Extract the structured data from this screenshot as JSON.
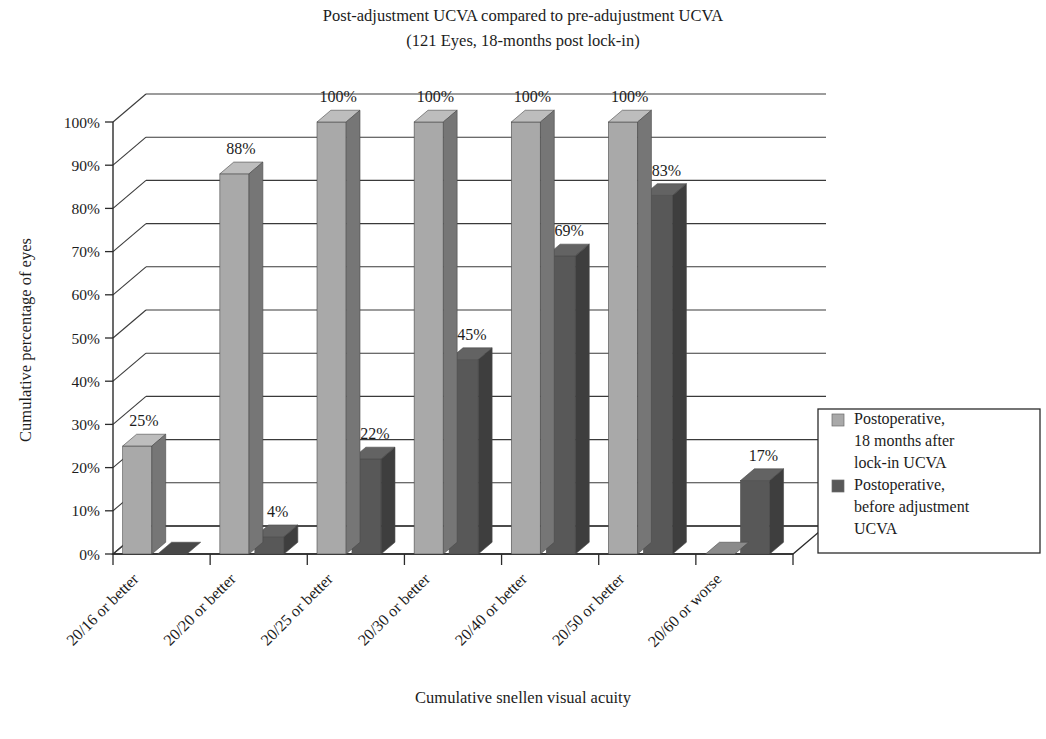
{
  "chart_data": {
    "type": "bar",
    "title": "Post-adjustment UCVA compared to pre-adujustment UCVA",
    "subtitle": "(121 Eyes, 18-months post lock-in)",
    "xlabel": "Cumulative snellen visual acuity",
    "ylabel": "Cumulative percentage of eyes",
    "ylim": [
      0,
      100
    ],
    "grid": true,
    "legend_position": "right",
    "three_d": true,
    "categories": [
      "20/16 or better",
      "20/20 or better",
      "20/25 or better",
      "20/30 or better",
      "20/40 or better",
      "20/50 or better",
      "20/60 or worse"
    ],
    "series": [
      {
        "name": "Postoperative, 18 months after lock-in UCVA",
        "color": "#a9a9a9",
        "values": [
          25,
          88,
          100,
          100,
          100,
          100,
          0
        ],
        "labels": [
          "25%",
          "88%",
          "100%",
          "100%",
          "100%",
          "100%",
          ""
        ]
      },
      {
        "name": "Postoperative, before adjustment UCVA",
        "color": "#585858",
        "values": [
          0,
          4,
          22,
          45,
          69,
          83,
          17
        ],
        "labels": [
          "",
          "4%",
          "22%",
          "45%",
          "69%",
          "83%",
          "17%"
        ]
      }
    ],
    "yticks": [
      "0%",
      "10%",
      "20%",
      "30%",
      "40%",
      "50%",
      "60%",
      "70%",
      "80%",
      "90%",
      "100%"
    ],
    "ytick_values": [
      0,
      10,
      20,
      30,
      40,
      50,
      60,
      70,
      80,
      90,
      100
    ]
  },
  "legend": {
    "entries": [
      {
        "swatch_color": "#a9a9a9",
        "lines": [
          "Postoperative,",
          "18 months after",
          "lock-in UCVA"
        ]
      },
      {
        "swatch_color": "#585858",
        "lines": [
          "Postoperative,",
          "before adjustment",
          "UCVA"
        ]
      }
    ]
  }
}
